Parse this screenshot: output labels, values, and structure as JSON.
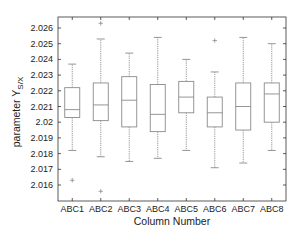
{
  "chart_data": {
    "type": "box",
    "title": "",
    "xlabel": "Column Number",
    "ylabel": "parameter Y",
    "ylabel_subscript": "S/X",
    "ylim": [
      2.0151,
      2.0269
    ],
    "yticks": [
      2.016,
      2.017,
      2.018,
      2.019,
      2.02,
      2.021,
      2.022,
      2.023,
      2.024,
      2.025,
      2.026
    ],
    "ytick_labels": [
      "2.016",
      "2.017",
      "2.018",
      "2.019",
      "2.02",
      "2.021",
      "2.022",
      "2.023",
      "2.024",
      "2.025",
      "2.026"
    ],
    "categories": [
      "ABC1",
      "ABC2",
      "ABC3",
      "ABC4",
      "ABC5",
      "ABC6",
      "ABC7",
      "ABC8"
    ],
    "grid": false,
    "boxes": [
      {
        "name": "ABC1",
        "whisker_low": 2.0182,
        "q1": 2.0203,
        "median": 2.0208,
        "q3": 2.0222,
        "whisker_high": 2.0237,
        "outliers": [
          2.0163
        ]
      },
      {
        "name": "ABC2",
        "whisker_low": 2.0178,
        "q1": 2.0201,
        "median": 2.0211,
        "q3": 2.0225,
        "whisker_high": 2.0253,
        "outliers": [
          2.0263,
          2.0156
        ]
      },
      {
        "name": "ABC3",
        "whisker_low": 2.0175,
        "q1": 2.0197,
        "median": 2.0214,
        "q3": 2.0229,
        "whisker_high": 2.0244,
        "outliers": []
      },
      {
        "name": "ABC4",
        "whisker_low": 2.0177,
        "q1": 2.0194,
        "median": 2.0205,
        "q3": 2.0224,
        "whisker_high": 2.0254,
        "outliers": []
      },
      {
        "name": "ABC5",
        "whisker_low": 2.0182,
        "q1": 2.0206,
        "median": 2.0216,
        "q3": 2.0226,
        "whisker_high": 2.024,
        "outliers": []
      },
      {
        "name": "ABC6",
        "whisker_low": 2.0171,
        "q1": 2.0197,
        "median": 2.0206,
        "q3": 2.0216,
        "whisker_high": 2.0232,
        "outliers": [
          2.0252
        ]
      },
      {
        "name": "ABC7",
        "whisker_low": 2.0174,
        "q1": 2.0195,
        "median": 2.021,
        "q3": 2.0225,
        "whisker_high": 2.0254,
        "outliers": []
      },
      {
        "name": "ABC8",
        "whisker_low": 2.0182,
        "q1": 2.02,
        "median": 2.0218,
        "q3": 2.0225,
        "whisker_high": 2.025,
        "outliers": []
      }
    ]
  },
  "style": {
    "box_color": "#8a8a8a",
    "whisker_color": "#8a8a8a",
    "outlier_color": "#8a8a8a",
    "axis_color": "#333333"
  }
}
